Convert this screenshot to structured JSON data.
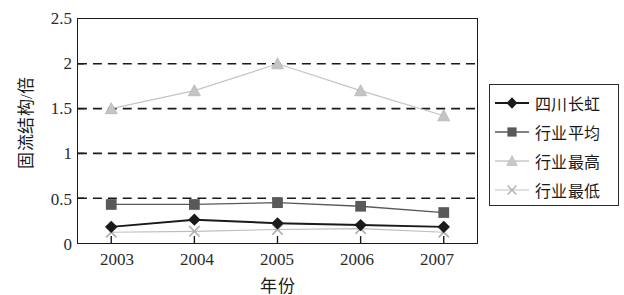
{
  "chart_data": {
    "type": "line",
    "title": "",
    "xlabel": "年份",
    "ylabel": "固流结构/倍",
    "categories": [
      "2003",
      "2004",
      "2005",
      "2006",
      "2007"
    ],
    "x": [
      2003,
      2004,
      2005,
      2006,
      2007
    ],
    "xlim": [
      2002.6,
      2007.4
    ],
    "ylim": [
      0,
      2.5
    ],
    "yticks": [
      "0",
      "0.5",
      "1",
      "1.5",
      "2",
      "2.5"
    ],
    "ytick_values": [
      0,
      0.5,
      1,
      1.5,
      2,
      2.5
    ],
    "grid": "horizontal-dashed",
    "legend_position": "right-outside",
    "series": [
      {
        "name": "四川长虹",
        "values": [
          0.18,
          0.26,
          0.22,
          0.2,
          0.18
        ],
        "marker": "diamond",
        "color": "#1a1a1a",
        "line_width": 2.0
      },
      {
        "name": "行业平均",
        "values": [
          0.43,
          0.43,
          0.45,
          0.41,
          0.34
        ],
        "marker": "square",
        "color": "#595959",
        "line_width": 1.3
      },
      {
        "name": "行业最高",
        "values": [
          1.5,
          1.7,
          2.0,
          1.7,
          1.42
        ],
        "marker": "triangle",
        "color": "#c4c4c4",
        "line_width": 1.2
      },
      {
        "name": "行业最低",
        "values": [
          0.12,
          0.13,
          0.15,
          0.16,
          0.12
        ],
        "marker": "x",
        "color": "#bdbdbd",
        "line_width": 1.1
      }
    ]
  },
  "axes": {
    "y_title": "固流结构/倍",
    "x_title": "年份",
    "y_tick_labels": [
      "2.5",
      "2",
      "1.5",
      "1",
      "0.5",
      "0"
    ],
    "x_tick_labels": [
      "2003",
      "2004",
      "2005",
      "2006",
      "2007"
    ]
  },
  "legend": {
    "items": [
      {
        "label": "四川长虹"
      },
      {
        "label": "行业平均"
      },
      {
        "label": "行业最高"
      },
      {
        "label": "行业最低"
      }
    ]
  },
  "colors": {
    "series_1": "#1a1a1a",
    "series_2": "#595959",
    "series_3": "#c4c4c4",
    "series_4": "#bdbdbd",
    "frame": "#1a1a1a",
    "grid": "#1a1a1a",
    "background": "#ffffff"
  }
}
